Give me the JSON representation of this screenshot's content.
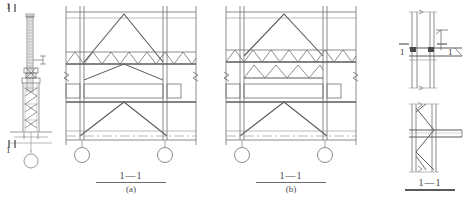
{
  "drawing": {
    "title": "Tower crane attachment / section details",
    "line_color": "#6e6e6e",
    "heavy_line_color": "#4a4a4a",
    "centerline_color": "#9a9a9a",
    "background": "#ffffff"
  },
  "left_elevation": {
    "name": "tower-crane-elevation",
    "section_marker_top": "1",
    "section_marker_top_tick": "1",
    "section_marker_bottom": "1",
    "section_marker_bottom_tick": "1"
  },
  "panel_a": {
    "label_section": "1—1",
    "label_sub": "(a)",
    "truss_rows": 1,
    "zigzag_count": 7,
    "wheels": 2
  },
  "panel_b": {
    "label_section": "1—1",
    "label_sub": "(b)",
    "truss_rows": 2,
    "zigzag_count_top": 7,
    "zigzag_count_bottom": 6,
    "wheels": 2
  },
  "detail_top_right": {
    "name": "connection-detail-plan",
    "marker_left": "1",
    "marker_right": "1"
  },
  "detail_bottom_right": {
    "name": "connection-detail-section",
    "label_section": "1—1"
  }
}
